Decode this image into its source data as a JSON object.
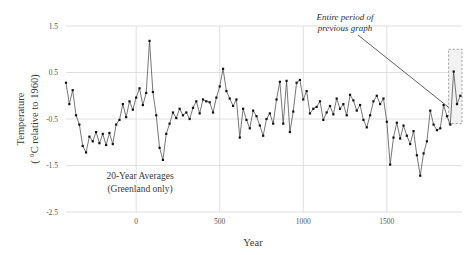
{
  "chart_data": {
    "type": "line",
    "title": "",
    "xlabel": "Year",
    "ylabel_line1": "Temperature",
    "ylabel_line2": "( °C relative to 1960)",
    "xlim": [
      -420,
      1950
    ],
    "ylim": [
      -2.5,
      1.5
    ],
    "xticks": [
      0,
      500,
      1000,
      1500
    ],
    "xtick_labels": [
      "0",
      "500",
      "1000",
      "1500"
    ],
    "yticks": [
      1.5,
      0.5,
      -0.5,
      -1.5,
      -2.5
    ],
    "ytick_labels": [
      "1.5",
      "0.5",
      "-0.5",
      "-1.5",
      "-2.5"
    ],
    "grid": true,
    "legend": "none",
    "series_name": "20-Year Averages (Greenland only)",
    "marker": "square",
    "line_color": "#4a4a4a",
    "marker_color": "#111111",
    "grid_color": "#d8d8d8",
    "x": [
      -420,
      -400,
      -380,
      -360,
      -340,
      -320,
      -300,
      -280,
      -260,
      -240,
      -220,
      -200,
      -180,
      -160,
      -140,
      -120,
      -100,
      -80,
      -60,
      -40,
      -20,
      0,
      20,
      40,
      60,
      80,
      100,
      120,
      140,
      160,
      180,
      200,
      220,
      240,
      260,
      280,
      300,
      320,
      340,
      360,
      380,
      400,
      420,
      440,
      460,
      480,
      500,
      520,
      540,
      560,
      580,
      600,
      620,
      640,
      660,
      680,
      700,
      720,
      740,
      760,
      780,
      800,
      820,
      840,
      860,
      880,
      900,
      920,
      940,
      960,
      980,
      1000,
      1020,
      1040,
      1060,
      1080,
      1100,
      1120,
      1140,
      1160,
      1180,
      1200,
      1220,
      1240,
      1260,
      1280,
      1300,
      1320,
      1340,
      1360,
      1380,
      1400,
      1420,
      1440,
      1460,
      1480,
      1500,
      1520,
      1540,
      1560,
      1580,
      1600,
      1620,
      1640,
      1660,
      1680,
      1700,
      1720,
      1740,
      1760,
      1780,
      1800,
      1820,
      1840,
      1860,
      1880,
      1900,
      1920,
      1940
    ],
    "values": [
      0.28,
      -0.18,
      0.12,
      -0.42,
      -0.62,
      -1.08,
      -1.22,
      -0.88,
      -0.98,
      -0.78,
      -1.02,
      -0.82,
      -1.06,
      -0.8,
      -1.04,
      -0.62,
      -0.52,
      -0.18,
      -0.46,
      -0.12,
      -0.3,
      -0.04,
      0.16,
      -0.2,
      0.06,
      1.18,
      0.08,
      -0.42,
      -1.12,
      -1.38,
      -0.82,
      -0.6,
      -0.36,
      -0.48,
      -0.28,
      -0.42,
      -0.36,
      -0.5,
      -0.26,
      -0.12,
      -0.38,
      -0.08,
      -0.12,
      -0.14,
      -0.36,
      -0.04,
      0.2,
      0.58,
      0.1,
      -0.06,
      -0.22,
      -0.08,
      -0.9,
      -0.28,
      -0.52,
      -0.7,
      -0.32,
      -0.44,
      -0.64,
      -0.86,
      -0.5,
      -0.38,
      -0.6,
      -0.08,
      0.3,
      -0.6,
      0.32,
      -0.78,
      -0.34,
      0.28,
      0.34,
      -0.08,
      0.1,
      -0.38,
      -0.28,
      -0.24,
      -0.12,
      -0.52,
      -0.36,
      -0.22,
      -0.4,
      -0.06,
      -0.28,
      -0.18,
      -0.42,
      0.02,
      -0.1,
      -0.32,
      -0.2,
      -0.52,
      -0.68,
      -0.42,
      -0.12,
      0.0,
      -0.18,
      -0.06,
      -0.56,
      -1.48,
      -0.9,
      -0.58,
      -0.92,
      -0.64,
      -0.86,
      -1.04,
      -0.76,
      -1.28,
      -1.72,
      -1.24,
      -0.98,
      -0.32,
      -0.62,
      -0.74,
      -0.7,
      -0.2,
      -0.44,
      -0.62,
      0.52,
      -0.18,
      0.0
    ],
    "annotations": [
      {
        "name": "series-note",
        "text_line1": "20-Year Averages",
        "text_line2": "(Greenland only)",
        "x_px": 140,
        "y_px": 179
      },
      {
        "name": "callout",
        "text_line1": "Entire period of",
        "text_line2": "previous graph",
        "x_px": 345,
        "y_px": 20
      }
    ],
    "highlight_box": {
      "name": "previous-graph-period",
      "x_start": 1870,
      "x_end": 1950,
      "y_top": 1.0,
      "y_bottom": -0.6,
      "style": "dashed",
      "fill": "#f2f2f2",
      "stroke": "#9a9a9a"
    }
  }
}
